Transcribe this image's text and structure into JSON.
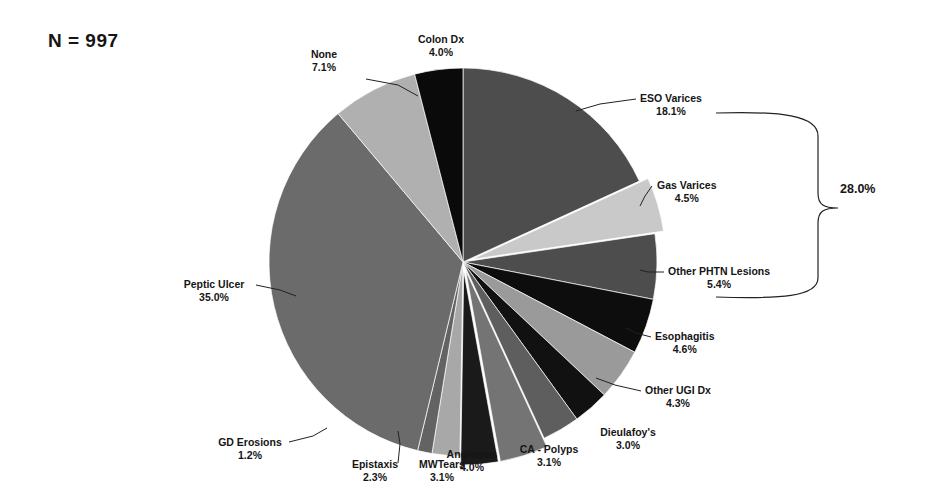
{
  "figure": {
    "sample_size_label": "N = 997",
    "background": "#ffffff",
    "text_color": "#151515"
  },
  "chart_data": {
    "type": "pie",
    "title": "",
    "subtitle": "",
    "xlabel": "",
    "ylabel": "",
    "total_n": 997,
    "start_angle_deg": 0,
    "direction": "clockwise",
    "legend": "none",
    "grid": false,
    "annotations": [
      {
        "name": "portal-hypertension-bracket",
        "label": "28.0%",
        "covers": [
          "ESO Varices",
          "Gas Varices",
          "Other PHTN Lesions"
        ],
        "value": 28.0
      }
    ],
    "categories": [
      "ESO Varices",
      "Gas Varices",
      "Other PHTN Lesions",
      "Esophagitis",
      "Other UGI Dx",
      "Dieulafoy's",
      "CA - Polyps",
      "Angiomas",
      "MWTears",
      "Epistaxis",
      "GD Erosions",
      "Peptic Ulcer",
      "None",
      "Colon Dx"
    ],
    "values": [
      18.1,
      4.5,
      5.4,
      4.6,
      4.3,
      3.0,
      3.1,
      4.0,
      3.1,
      2.3,
      1.2,
      35.0,
      7.1,
      4.0
    ],
    "slices": [
      {
        "label": "ESO Varices",
        "pct": 18.1,
        "pct_text": "18.1%",
        "color": "#4d4d4d",
        "exploded": false
      },
      {
        "label": "Gas Varices",
        "pct": 4.5,
        "pct_text": "4.5%",
        "color": "#c9c9c9",
        "exploded": true
      },
      {
        "label": "Other PHTN Lesions",
        "pct": 5.4,
        "pct_text": "5.4%",
        "color": "#4d4d4d",
        "exploded": false
      },
      {
        "label": "Esophagitis",
        "pct": 4.6,
        "pct_text": "4.6%",
        "color": "#0d0d0d",
        "exploded": false
      },
      {
        "label": "Other UGI Dx",
        "pct": 4.3,
        "pct_text": "4.3%",
        "color": "#9a9a9a",
        "exploded": false
      },
      {
        "label": "Dieulafoy's",
        "pct": 3.0,
        "pct_text": "3.0%",
        "color": "#111111",
        "exploded": false
      },
      {
        "label": "CA - Polyps",
        "pct": 3.1,
        "pct_text": "3.1%",
        "color": "#5e5e5e",
        "exploded": false
      },
      {
        "label": "Angiomas",
        "pct": 4.0,
        "pct_text": "4.0%",
        "color": "#747474",
        "exploded": true
      },
      {
        "label": "MWTears",
        "pct": 3.1,
        "pct_text": "3.1%",
        "color": "#1a1a1a",
        "exploded": true
      },
      {
        "label": "Epistaxis",
        "pct": 2.3,
        "pct_text": "2.3%",
        "color": "#a8a8a8",
        "exploded": false
      },
      {
        "label": "GD Erosions",
        "pct": 1.2,
        "pct_text": "1.2%",
        "color": "#636363",
        "exploded": false
      },
      {
        "label": "Peptic Ulcer",
        "pct": 35.0,
        "pct_text": "35.0%",
        "color": "#6b6b6b",
        "exploded": false
      },
      {
        "label": "None",
        "pct": 7.1,
        "pct_text": "7.1%",
        "color": "#b0b0b0",
        "exploded": false
      },
      {
        "label": "Colon Dx",
        "pct": 4.0,
        "pct_text": "4.0%",
        "color": "#0a0a0a",
        "exploded": false
      }
    ]
  },
  "callouts": [
    {
      "key": "colon_dx",
      "label": "Colon Dx",
      "pct_text": "4.0%"
    },
    {
      "key": "none",
      "label": "None",
      "pct_text": "7.1%"
    },
    {
      "key": "eso_varices",
      "label": "ESO Varices",
      "pct_text": "18.1%"
    },
    {
      "key": "gas_varices",
      "label": "Gas Varices",
      "pct_text": "4.5%"
    },
    {
      "key": "other_phtn",
      "label": "Other PHTN Lesions",
      "pct_text": "5.4%"
    },
    {
      "key": "esophagitis",
      "label": "Esophagitis",
      "pct_text": "4.6%"
    },
    {
      "key": "other_ugi",
      "label": "Other UGI  Dx",
      "pct_text": "4.3%"
    },
    {
      "key": "dieulafoy",
      "label": "Dieulafoy's",
      "pct_text": "3.0%"
    },
    {
      "key": "ca_polyps",
      "label": "CA - Polyps",
      "pct_text": "3.1%"
    },
    {
      "key": "angiomas",
      "label": "Angiomas",
      "pct_text": "4.0%"
    },
    {
      "key": "mwtears",
      "label": "MWTears",
      "pct_text": "3.1%"
    },
    {
      "key": "epistaxis",
      "label": "Epistaxis",
      "pct_text": "2.3%"
    },
    {
      "key": "gd_erosions",
      "label": "GD Erosions",
      "pct_text": "1.2%"
    },
    {
      "key": "peptic_ulcer",
      "label": "Peptic Ulcer",
      "pct_text": "35.0%"
    }
  ],
  "bracket": {
    "total_text": "28.0%"
  }
}
